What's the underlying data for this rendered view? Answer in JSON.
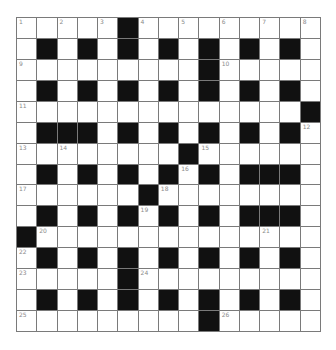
{
  "puzzle": {
    "rows": 15,
    "cols": 15,
    "colors": {
      "block": "#111111",
      "cell": "#ffffff",
      "gridline": "#7a7a7a",
      "number": "#8a8a8a"
    },
    "layout": [
      ".....#.........",
      ".#.#.#.#.#.#.#.",
      ".........#.....",
      ".#.#.#.#.#.#.#.",
      "..............#",
      ".###.#.#.#.#.#.",
      "........#......",
      ".#.#.#.#.#.###.",
      "......#........",
      ".#.#.#.#.#.###.",
      "#..............",
      ".#.#.#.#.#.#.#.",
      ".....#.........",
      ".#.#.#.#.#.#.#.",
      ".........#....."
    ],
    "numbers": [
      {
        "r": 0,
        "c": 0,
        "n": "1"
      },
      {
        "r": 0,
        "c": 2,
        "n": "2"
      },
      {
        "r": 0,
        "c": 4,
        "n": "3"
      },
      {
        "r": 0,
        "c": 6,
        "n": "4"
      },
      {
        "r": 0,
        "c": 8,
        "n": "5"
      },
      {
        "r": 0,
        "c": 10,
        "n": "6"
      },
      {
        "r": 0,
        "c": 12,
        "n": "7"
      },
      {
        "r": 0,
        "c": 14,
        "n": "8"
      },
      {
        "r": 2,
        "c": 0,
        "n": "9"
      },
      {
        "r": 2,
        "c": 10,
        "n": "10"
      },
      {
        "r": 4,
        "c": 0,
        "n": "11"
      },
      {
        "r": 5,
        "c": 14,
        "n": "12"
      },
      {
        "r": 6,
        "c": 0,
        "n": "13"
      },
      {
        "r": 6,
        "c": 2,
        "n": "14"
      },
      {
        "r": 6,
        "c": 9,
        "n": "15"
      },
      {
        "r": 7,
        "c": 8,
        "n": "16"
      },
      {
        "r": 8,
        "c": 0,
        "n": "17"
      },
      {
        "r": 8,
        "c": 7,
        "n": "18"
      },
      {
        "r": 9,
        "c": 6,
        "n": "19"
      },
      {
        "r": 10,
        "c": 1,
        "n": "20"
      },
      {
        "r": 10,
        "c": 12,
        "n": "21"
      },
      {
        "r": 11,
        "c": 0,
        "n": "22"
      },
      {
        "r": 12,
        "c": 0,
        "n": "23"
      },
      {
        "r": 12,
        "c": 6,
        "n": "24"
      },
      {
        "r": 14,
        "c": 0,
        "n": "25"
      },
      {
        "r": 14,
        "c": 10,
        "n": "26"
      }
    ],
    "entries": {}
  }
}
